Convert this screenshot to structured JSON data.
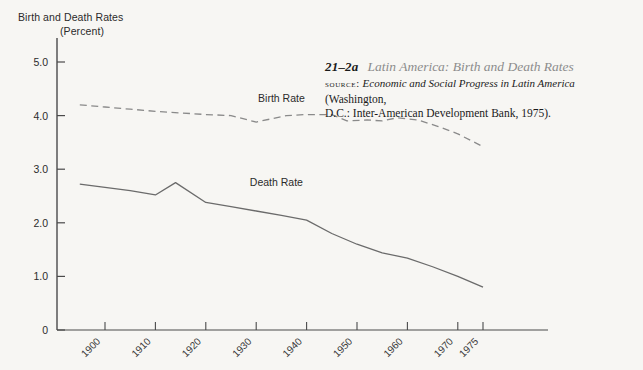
{
  "axis_title": {
    "line1": "Birth and Death Rates",
    "line2": "(Percent)"
  },
  "caption": {
    "number": "21–2a",
    "title": "Latin America: Birth and Death Rates",
    "source_word": "source:",
    "source_title": "Economic and Social Progress in Latin America",
    "source_rest": " (Washington,",
    "source_line2": "D.C.: Inter-American Development Bank, 1975)."
  },
  "chart_data": {
    "type": "line",
    "title": "Latin America: Birth and Death Rates",
    "xlabel": "",
    "ylabel": "Birth and Death Rates (Percent)",
    "xlim": [
      1895,
      1985
    ],
    "ylim": [
      0,
      5.4
    ],
    "yticks": [
      0,
      1.0,
      2.0,
      3.0,
      4.0,
      5.0
    ],
    "ytick_labels": [
      "0",
      "1.0",
      "2.0",
      "3.0",
      "4.0",
      "5.0"
    ],
    "xticks": [
      1900,
      1910,
      1920,
      1930,
      1940,
      1950,
      1960,
      1970,
      1975
    ],
    "xtick_labels": [
      "1900",
      "1910",
      "1920",
      "1930",
      "1940",
      "1950",
      "1960",
      "1970",
      "1975"
    ],
    "grid": false,
    "legend": "inline-labels",
    "series": [
      {
        "name": "Birth Rate",
        "style": "dashed",
        "color": "#8a8a8a",
        "label_x": 1935,
        "label_y": 4.25,
        "x": [
          1895,
          1900,
          1905,
          1910,
          1915,
          1920,
          1925,
          1930,
          1933,
          1936,
          1940,
          1945,
          1948,
          1952,
          1955,
          1958,
          1962,
          1966,
          1970,
          1975
        ],
        "y": [
          4.2,
          4.16,
          4.12,
          4.08,
          4.05,
          4.02,
          4.0,
          3.88,
          3.94,
          4.0,
          4.02,
          4.02,
          3.9,
          3.92,
          3.9,
          3.96,
          3.92,
          3.8,
          3.66,
          3.42
        ]
      },
      {
        "name": "Death Rate",
        "style": "solid",
        "color": "#6b6b6b",
        "label_x": 1934,
        "label_y": 2.68,
        "x": [
          1895,
          1900,
          1905,
          1910,
          1914,
          1920,
          1925,
          1930,
          1935,
          1940,
          1945,
          1950,
          1955,
          1960,
          1965,
          1970,
          1975
        ],
        "y": [
          2.72,
          2.66,
          2.6,
          2.52,
          2.75,
          2.38,
          2.3,
          2.22,
          2.14,
          2.05,
          1.8,
          1.6,
          1.44,
          1.34,
          1.18,
          1.0,
          0.8
        ]
      }
    ]
  }
}
